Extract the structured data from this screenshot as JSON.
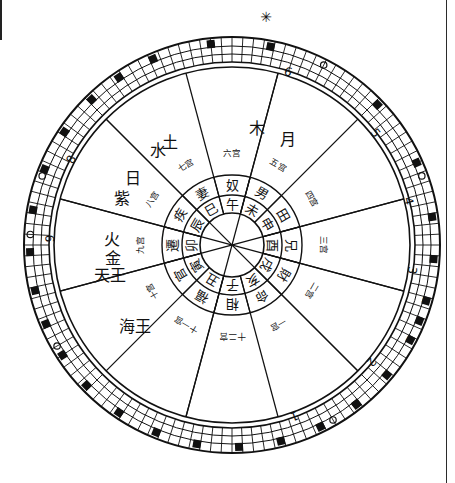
{
  "document": {
    "title": "十二宫星盘图",
    "type": "hand-drawn astrological chart",
    "top_mark": "✳",
    "ink_color": "#111111",
    "paper_color": "#ffffff",
    "page_edge_color": "#2b2b2b"
  },
  "rings": {
    "outer_degree_ring": {
      "name": "outer-degree-ring",
      "cell_count": 120,
      "numbers": [
        {
          "label": "6",
          "angle_deg": -72
        },
        {
          "label": "5",
          "angle_deg": -38
        },
        {
          "label": "4",
          "angle_deg": -14
        },
        {
          "label": "3",
          "angle_deg": 8
        },
        {
          "label": "2",
          "angle_deg": 40
        },
        {
          "label": "1",
          "angle_deg": 70
        },
        {
          "label": "9",
          "angle_deg": 182
        },
        {
          "label": "8",
          "angle_deg": 208
        }
      ],
      "marked_cells": [
        {
          "text": "漸",
          "angle_deg": -96
        },
        {
          "text": "鬼",
          "angle_deg": -79
        },
        {
          "text": "柳",
          "angle_deg": -113
        },
        {
          "text": "星",
          "angle_deg": -124
        },
        {
          "text": "張",
          "angle_deg": -134
        },
        {
          "text": "翼",
          "angle_deg": -146
        },
        {
          "text": "軫",
          "angle_deg": -158
        },
        {
          "text": "角",
          "angle_deg": -170
        },
        {
          "text": "亢",
          "angle_deg": -182
        },
        {
          "text": "氐",
          "angle_deg": -193
        },
        {
          "text": "房",
          "angle_deg": -203
        },
        {
          "text": "心",
          "angle_deg": -213
        },
        {
          "text": "尾",
          "angle_deg": -224
        },
        {
          "text": "箕",
          "angle_deg": -236
        },
        {
          "text": "斗",
          "angle_deg": -248
        },
        {
          "text": "牛",
          "angle_deg": -260
        },
        {
          "text": "女",
          "angle_deg": -272
        },
        {
          "text": "虛",
          "angle_deg": -284
        },
        {
          "text": "危",
          "angle_deg": -296
        },
        {
          "text": "室",
          "angle_deg": -308
        },
        {
          "text": "壁",
          "angle_deg": -320
        },
        {
          "text": "奎",
          "angle_deg": -332
        },
        {
          "text": "婁",
          "angle_deg": -344
        },
        {
          "text": "胃",
          "angle_deg": -356
        },
        {
          "text": "昴",
          "angle_deg": -44
        },
        {
          "text": "畢",
          "angle_deg": -24
        },
        {
          "text": "觜",
          "angle_deg": -8
        },
        {
          "text": "參",
          "angle_deg": 22
        },
        {
          "text": "井",
          "angle_deg": 52
        }
      ],
      "circle_markers_count": 7
    },
    "planet_zone": {
      "name": "planet-zone",
      "planets": [
        {
          "symbol": "木",
          "name": "jupiter",
          "angle_deg": -78
        },
        {
          "symbol": "月",
          "name": "moon",
          "angle_deg": -62
        },
        {
          "symbol": "土",
          "name": "saturn",
          "angle_deg": -121
        },
        {
          "symbol": "水",
          "name": "mercury",
          "angle_deg": -128
        },
        {
          "symbol": "日",
          "name": "sun",
          "angle_deg": -146
        },
        {
          "symbol": "紫",
          "name": "purple-star",
          "angle_deg": -157
        },
        {
          "symbol": "火",
          "name": "mars",
          "angle_deg": 183
        },
        {
          "symbol": "金",
          "name": "venus",
          "angle_deg": 174
        },
        {
          "symbol": "天王",
          "name": "uranus",
          "angle_deg": 166
        },
        {
          "symbol": "海王",
          "name": "neptune",
          "angle_deg": 140
        }
      ]
    },
    "house_ring": {
      "name": "twelve-houses-ring",
      "houses": [
        {
          "house": "相",
          "ordinal": "十二宫",
          "angle_deg": 90
        },
        {
          "house": "命",
          "ordinal": "一宫",
          "angle_deg": 60
        },
        {
          "house": "財",
          "ordinal": "二宫",
          "angle_deg": 30
        },
        {
          "house": "兄",
          "ordinal": "三宫",
          "angle_deg": 0
        },
        {
          "house": "田",
          "ordinal": "四宫",
          "angle_deg": -30
        },
        {
          "house": "男",
          "ordinal": "五宫",
          "angle_deg": -60
        },
        {
          "house": "奴",
          "ordinal": "六宫",
          "angle_deg": -90
        },
        {
          "house": "妻",
          "ordinal": "七宫",
          "angle_deg": -120
        },
        {
          "house": "疾",
          "ordinal": "八宫",
          "angle_deg": -150
        },
        {
          "house": "遷",
          "ordinal": "九宫",
          "angle_deg": 180
        },
        {
          "house": "官",
          "ordinal": "十宫",
          "angle_deg": 150
        },
        {
          "house": "福",
          "ordinal": "十一宫",
          "angle_deg": 120
        }
      ]
    },
    "branch_ring": {
      "name": "twelve-earthly-branches-ring",
      "branches": [
        {
          "char": "子",
          "angle_deg": 90
        },
        {
          "char": "亥",
          "angle_deg": 60
        },
        {
          "char": "戌",
          "angle_deg": 30
        },
        {
          "char": "酉",
          "angle_deg": 0
        },
        {
          "char": "申",
          "angle_deg": -30
        },
        {
          "char": "未",
          "angle_deg": -60
        },
        {
          "char": "午",
          "angle_deg": -90
        },
        {
          "char": "巳",
          "angle_deg": -120
        },
        {
          "char": "辰",
          "angle_deg": -150
        },
        {
          "char": "卯",
          "angle_deg": 180
        },
        {
          "char": "寅",
          "angle_deg": 150
        },
        {
          "char": "丑",
          "angle_deg": 120
        }
      ]
    }
  },
  "geometry": {
    "center_x": 232,
    "center_y": 245,
    "r_outer": 208,
    "r_outer_inner": 183,
    "r_mid_outer": 178,
    "r_planet_zone": 120,
    "r_house_outer": 70,
    "r_house_inner": 50,
    "r_branch_inner": 32
  }
}
